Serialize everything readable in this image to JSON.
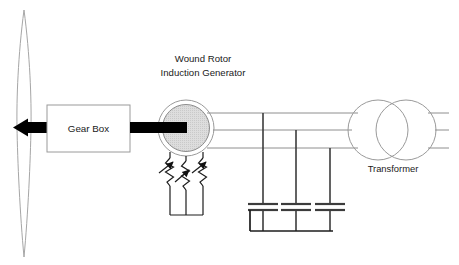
{
  "diagram": {
    "title_text": "",
    "labels": {
      "generator_line1": "Wound Rotor",
      "generator_line2": "Induction Generator",
      "gearbox": "Gear Box",
      "transformer": "Transformer"
    },
    "components": [
      {
        "name": "turbine-blade",
        "type": "wind-turbine-blade",
        "label": ""
      },
      {
        "name": "rotor-hub",
        "type": "hub-arrow",
        "label": ""
      },
      {
        "name": "low-speed-shaft",
        "type": "shaft",
        "label": ""
      },
      {
        "name": "gear-box",
        "type": "box",
        "label": "Gear Box"
      },
      {
        "name": "high-speed-shaft",
        "type": "shaft",
        "label": ""
      },
      {
        "name": "generator",
        "type": "circle-machine",
        "label": "Wound Rotor Induction Generator"
      },
      {
        "name": "rotor-resistors",
        "type": "variable-resistor-bank",
        "label": "",
        "count": 3
      },
      {
        "name": "stator-bus",
        "type": "three-phase-line",
        "label": "",
        "phases": 3
      },
      {
        "name": "capacitor-bank",
        "type": "capacitor-bank",
        "label": "",
        "count": 3
      },
      {
        "name": "transformer",
        "type": "two-winding-transformer",
        "label": "Transformer"
      },
      {
        "name": "grid-feeder",
        "type": "three-phase-line",
        "label": "",
        "phases": 3
      }
    ],
    "colors": {
      "background": "#ffffff",
      "shaft_black": "#000000",
      "wire_gray": "#8e8e8e",
      "wire_dark": "#3c3c3c",
      "bus_black": "#1c1c1c",
      "outline_gray": "#9a9a9a",
      "blade_outline": "#a6a6a6",
      "generator_fill": "#d8d8d8",
      "text": "#1a1a1a"
    },
    "geometry": {
      "phase_line_y": [
        113,
        130,
        148
      ],
      "capacitor_x": [
        263,
        296,
        330
      ],
      "capacitor_plate_y": [
        204,
        210
      ],
      "capacitor_bus_y": 231,
      "resistor_x": [
        170,
        186,
        203
      ],
      "resistor_bus_y": 215
    }
  }
}
